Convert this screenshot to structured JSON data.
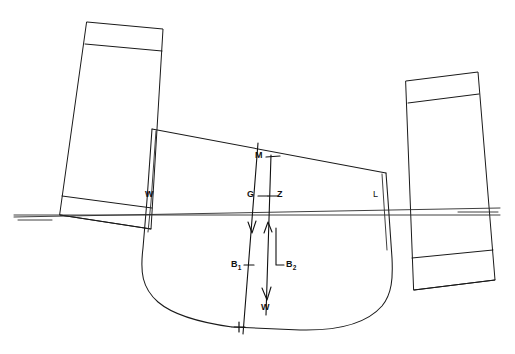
{
  "figure": {
    "domain": "diagram",
    "kind": "naval-architecture-stability-diagram",
    "background_color": "#ffffff",
    "line_color": "#1a1a1a",
    "heel_direction": "starboard",
    "heel_angle_deg": 13
  },
  "labels": {
    "metacentre": "M",
    "centre_of_gravity": "G",
    "righting_lever_point": "Z",
    "buoyancy_upright": "B",
    "buoyancy_upright_sub": "1",
    "buoyancy_heeled": "B",
    "buoyancy_heeled_sub": "2",
    "weight_force": "W",
    "waterline_left": "W",
    "waterline_right": "L"
  },
  "annotations": [
    {
      "name": "metacentre-label",
      "text": "M",
      "x": 258,
      "y": 152,
      "marker": "tick"
    },
    {
      "name": "centre-of-gravity-label",
      "text": "G",
      "x": 250,
      "y": 192,
      "marker": "tick"
    },
    {
      "name": "righting-lever-label",
      "text": "Z",
      "x": 277,
      "y": 192,
      "marker": "tick"
    },
    {
      "name": "buoyancy-upright-label",
      "text": "B1",
      "x": 234,
      "y": 262,
      "marker": "tick"
    },
    {
      "name": "buoyancy-heeled-label",
      "text": "B2",
      "x": 281,
      "y": 262,
      "marker": "bracket"
    },
    {
      "name": "weight-force-label",
      "text": "W",
      "x": 263,
      "y": 305,
      "marker": "arrowhead-down"
    },
    {
      "name": "waterline-left-label",
      "text": "W",
      "x": 146,
      "y": 193,
      "marker": "none"
    },
    {
      "name": "waterline-right-label",
      "text": "L",
      "x": 374,
      "y": 193,
      "marker": "none"
    }
  ],
  "geometry": {
    "waterline_true": {
      "x1": 14,
      "y1": 215,
      "x2": 500,
      "y2": 215
    },
    "waterline_heeled": {
      "x1": 14,
      "y1": 217,
      "x2": 500,
      "y2": 208
    },
    "hull_deck": {
      "x1": 152,
      "y1": 129,
      "x2": 386,
      "y2": 173
    },
    "vertical_thrust_line": {
      "x1": 271,
      "y1": 155,
      "x2": 266,
      "y2": 315
    },
    "gravity_line": {
      "x1": 258,
      "y1": 143,
      "x2": 243,
      "y2": 334
    }
  },
  "pontoons": [
    {
      "name": "port-pontoon",
      "tilt_deg": 13,
      "bands": [
        "top-band",
        "bottom-band"
      ]
    },
    {
      "name": "starboard-pontoon",
      "tilt_deg": 13,
      "bands": [
        "top-band",
        "bottom-band"
      ]
    }
  ]
}
